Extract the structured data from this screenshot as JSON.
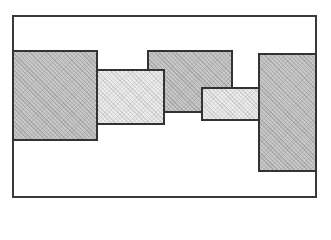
{
  "diagram": {
    "frame": {
      "x": 12,
      "y": 15,
      "w": 305,
      "h": 183,
      "fill": "#ffffff",
      "stroke": "#3a3a3a"
    },
    "rectangles": [
      {
        "id": "A",
        "shade": "dark",
        "x": 12,
        "y": 50,
        "w": 86,
        "h": 91,
        "z": 1
      },
      {
        "id": "B",
        "shade": "light",
        "x": 96,
        "y": 69,
        "w": 69,
        "h": 56,
        "z": 3
      },
      {
        "id": "C",
        "shade": "dark",
        "x": 147,
        "y": 50,
        "w": 86,
        "h": 63,
        "z": 2
      },
      {
        "id": "D",
        "shade": "light",
        "x": 201,
        "y": 87,
        "w": 59,
        "h": 34,
        "z": 4
      },
      {
        "id": "E",
        "shade": "dark",
        "x": 258,
        "y": 53,
        "w": 59,
        "h": 119,
        "z": 5
      }
    ],
    "colors": {
      "dark_fill": "#c8c8c8",
      "light_fill": "#ececec",
      "stroke": "#333333"
    }
  }
}
